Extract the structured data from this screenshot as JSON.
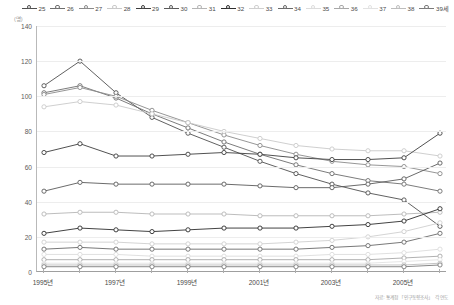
{
  "chart_data": {
    "type": "line",
    "title": "",
    "subtitle": "",
    "xlabel": "",
    "ylabel": "",
    "unit_label": "(명)",
    "ylim": [
      0,
      140
    ],
    "yticks": [
      0,
      20,
      40,
      60,
      80,
      100,
      120,
      140
    ],
    "grid": true,
    "legend_position": "top",
    "legend_title": "",
    "x": [
      "1995",
      "1996",
      "1997",
      "1998",
      "1999",
      "2000",
      "2001",
      "2002",
      "2003",
      "2004",
      "2005",
      "2006"
    ],
    "xtick_labels": [
      "1995년",
      "1997년",
      "1999년",
      "2001년",
      "2003년",
      "2005년"
    ],
    "xtick_values": [
      "1995",
      "1997",
      "1999",
      "2001",
      "2003",
      "2005"
    ],
    "source": "자료: 통계청 「인구동향조사」 각 연도",
    "series": [
      {
        "name": "25",
        "label": "25",
        "color": "#4f4f4f",
        "values": [
          106,
          120,
          102,
          88,
          79,
          71,
          63,
          56,
          50,
          45,
          41,
          26
        ]
      },
      {
        "name": "26",
        "label": "26",
        "color": "#6d6d6d",
        "values": [
          102,
          106,
          99,
          90,
          82,
          74,
          67,
          61,
          56,
          52,
          50,
          46
        ]
      },
      {
        "name": "27",
        "label": "27",
        "color": "#8a8a8a",
        "values": [
          101,
          105,
          100,
          92,
          85,
          78,
          72,
          67,
          63,
          61,
          60,
          56
        ]
      },
      {
        "name": "28",
        "label": "28",
        "color": "#c9c9c9",
        "values": [
          94,
          97,
          95,
          90,
          85,
          80,
          76,
          72,
          70,
          69,
          69,
          66
        ]
      },
      {
        "name": "29",
        "label": "29",
        "color": "#3d3d3d",
        "values": [
          68,
          73,
          66,
          66,
          67,
          68,
          67,
          65,
          64,
          64,
          65,
          79
        ]
      },
      {
        "name": "30",
        "label": "30",
        "color": "#5a5a5a",
        "values": [
          46,
          51,
          50,
          50,
          50,
          50,
          49,
          48,
          48,
          50,
          53,
          62
        ]
      },
      {
        "name": "31",
        "label": "31",
        "color": "#b5b5b5",
        "values": [
          33,
          34,
          34,
          33,
          33,
          33,
          32,
          32,
          32,
          32,
          33,
          34
        ]
      },
      {
        "name": "32",
        "label": "32",
        "color": "#2e2e2e",
        "values": [
          22,
          25,
          24,
          23,
          24,
          25,
          25,
          25,
          26,
          27,
          29,
          36
        ]
      },
      {
        "name": "33",
        "label": "33",
        "color": "#cfcfcf",
        "values": [
          17,
          17,
          17,
          16,
          16,
          16,
          16,
          17,
          18,
          20,
          23,
          28
        ]
      },
      {
        "name": "34",
        "label": "34",
        "color": "#696969",
        "values": [
          13,
          14,
          13,
          13,
          13,
          13,
          13,
          13,
          14,
          15,
          17,
          22
        ]
      },
      {
        "name": "35",
        "label": "35",
        "color": "#dcdcdc",
        "values": [
          10,
          10,
          10,
          9,
          9,
          9,
          9,
          9,
          10,
          10,
          11,
          13
        ]
      },
      {
        "name": "36",
        "label": "36",
        "color": "#a8a8a8",
        "values": [
          7,
          7,
          7,
          7,
          7,
          7,
          7,
          7,
          7,
          7,
          8,
          9
        ]
      },
      {
        "name": "37",
        "label": "37",
        "color": "#e2e2e2",
        "values": [
          5,
          5,
          5,
          5,
          5,
          5,
          5,
          5,
          5,
          5,
          6,
          7
        ]
      },
      {
        "name": "38",
        "label": "38",
        "color": "#bdbdbd",
        "values": [
          4,
          4,
          4,
          4,
          4,
          4,
          4,
          4,
          4,
          4,
          4,
          5
        ]
      },
      {
        "name": "39",
        "label": "39세",
        "color": "#7a7a7a",
        "values": [
          3,
          3,
          3,
          3,
          3,
          3,
          3,
          3,
          3,
          3,
          3,
          4
        ]
      }
    ]
  }
}
